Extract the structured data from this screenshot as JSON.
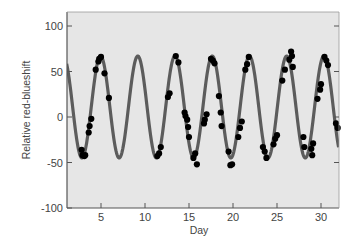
{
  "chart_data": {
    "type": "scatter",
    "title": "",
    "xlabel": "Day",
    "ylabel": "Relative red-blueshift",
    "xlim": [
      1.1,
      32.0
    ],
    "ylim": [
      -100,
      115
    ],
    "x_ticks": [
      5,
      10,
      15,
      20,
      25,
      30
    ],
    "y_ticks": [
      100,
      50,
      0,
      -50,
      -100
    ],
    "grid": false,
    "legend": null,
    "colors": {
      "plot_background": "#e6e6e6",
      "page_background": "#ffffff",
      "fit_curve": "#5c5c5c",
      "points": "#000000",
      "axes": "#555555"
    },
    "series": [
      {
        "name": "observations",
        "kind": "scatter",
        "points": [
          [
            2.8,
            -36
          ],
          [
            2.9,
            -42
          ],
          [
            3.1,
            -43
          ],
          [
            3.2,
            -42
          ],
          [
            3.6,
            -17
          ],
          [
            3.7,
            -10
          ],
          [
            3.9,
            -2
          ],
          [
            4.4,
            52
          ],
          [
            4.7,
            61
          ],
          [
            4.8,
            64
          ],
          [
            5.0,
            66
          ],
          [
            5.4,
            48
          ],
          [
            5.9,
            21
          ],
          [
            11.4,
            -43
          ],
          [
            11.6,
            -40
          ],
          [
            11.8,
            -33
          ],
          [
            12.6,
            22
          ],
          [
            12.8,
            26
          ],
          [
            13.5,
            67
          ],
          [
            13.8,
            60
          ],
          [
            14.5,
            5
          ],
          [
            14.6,
            1
          ],
          [
            14.8,
            -3
          ],
          [
            14.9,
            -11
          ],
          [
            15.0,
            -22
          ],
          [
            15.5,
            -45
          ],
          [
            15.7,
            -40
          ],
          [
            15.9,
            -52
          ],
          [
            16.7,
            -7
          ],
          [
            16.8,
            -3
          ],
          [
            17.0,
            3
          ],
          [
            17.5,
            64
          ],
          [
            17.7,
            62
          ],
          [
            17.9,
            59
          ],
          [
            18.4,
            23
          ],
          [
            18.6,
            5
          ],
          [
            18.7,
            -10
          ],
          [
            19.5,
            -38
          ],
          [
            19.7,
            -53
          ],
          [
            19.9,
            -52
          ],
          [
            20.6,
            -22
          ],
          [
            20.8,
            -12
          ],
          [
            21.0,
            -5
          ],
          [
            21.4,
            52
          ],
          [
            21.6,
            58
          ],
          [
            21.8,
            66
          ],
          [
            23.4,
            -33
          ],
          [
            23.6,
            -38
          ],
          [
            23.8,
            -45
          ],
          [
            24.6,
            -30
          ],
          [
            24.8,
            -24
          ],
          [
            25.0,
            -20
          ],
          [
            25.6,
            40
          ],
          [
            25.9,
            52
          ],
          [
            26.4,
            63
          ],
          [
            26.6,
            72
          ],
          [
            26.7,
            67
          ],
          [
            26.8,
            55
          ],
          [
            28.0,
            -22
          ],
          [
            28.1,
            -33
          ],
          [
            28.9,
            -35
          ],
          [
            29.0,
            -42
          ],
          [
            29.1,
            -29
          ],
          [
            29.6,
            20
          ],
          [
            29.9,
            30
          ],
          [
            30.0,
            36
          ],
          [
            30.4,
            66
          ],
          [
            30.6,
            62
          ],
          [
            30.8,
            57
          ],
          [
            31.7,
            -7
          ],
          [
            31.9,
            -12
          ]
        ]
      },
      {
        "name": "sinusoidal fit",
        "kind": "line",
        "model": "y = offset + amplitude * cos(2*pi*(t - t_peak)/period)",
        "offset": 11,
        "amplitude": 56,
        "period": 4.23,
        "t_peak": 4.95
      }
    ]
  }
}
